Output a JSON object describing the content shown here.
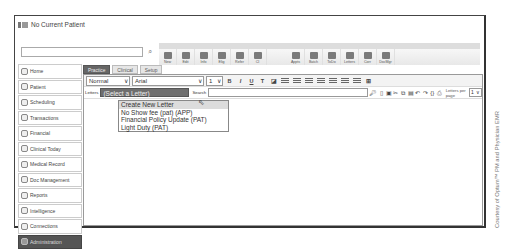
{
  "window": {
    "title": "No Current Patient"
  },
  "patient_search": {
    "value": "",
    "placeholder": ""
  },
  "toolbar": {
    "buttons": [
      {
        "label": "New",
        "icon": "new-icon"
      },
      {
        "label": "Edit",
        "icon": "edit-icon"
      },
      {
        "label": "Info",
        "icon": "info-icon"
      },
      {
        "label": "Elig",
        "icon": "eligibility-icon"
      },
      {
        "label": "Refer",
        "icon": "refer-icon"
      },
      {
        "label": "CI",
        "icon": "ci-icon"
      },
      {
        "label": "Appts",
        "icon": "appointments-icon"
      },
      {
        "label": "Batch",
        "icon": "batch-icon"
      },
      {
        "label": "ToDo",
        "icon": "todo-icon"
      },
      {
        "label": "Letters",
        "icon": "letters-icon"
      },
      {
        "label": "Corr",
        "icon": "correspondence-icon"
      },
      {
        "label": "DocMgr",
        "icon": "document-manager-icon"
      }
    ]
  },
  "sidebar": {
    "items": [
      {
        "label": "Home",
        "icon": "home-arrow-icon"
      },
      {
        "label": "Patient",
        "icon": "patient-icon"
      },
      {
        "label": "Scheduling",
        "icon": "clock-icon"
      },
      {
        "label": "Transactions",
        "icon": "transactions-icon"
      },
      {
        "label": "Financial",
        "icon": "financial-icon"
      },
      {
        "label": "Clinical Today",
        "icon": "stethoscope-icon"
      },
      {
        "label": "Medical Record",
        "icon": "medical-record-icon"
      },
      {
        "label": "Doc Management",
        "icon": "document-icon"
      },
      {
        "label": "Reports",
        "icon": "reports-icon"
      },
      {
        "label": "Intelligence",
        "icon": "intelligence-icon"
      },
      {
        "label": "Connections",
        "icon": "connections-icon"
      },
      {
        "label": "Administration",
        "icon": "gears-icon",
        "active": true
      }
    ]
  },
  "tabs": [
    {
      "label": "Practice",
      "active": true
    },
    {
      "label": "Clinical"
    },
    {
      "label": "Setup"
    }
  ],
  "format_bar": {
    "style": "Normal",
    "font": "Arial",
    "size": "1",
    "buttons": [
      "B",
      "I",
      "U"
    ]
  },
  "letter_bar": {
    "letters_label": "Letters",
    "letter_selected": "(Select a Letter)",
    "search_label": "Search",
    "search_value": "",
    "letters_per_page_label": "Letters per page",
    "letters_per_page_value": "1"
  },
  "letter_dropdown": {
    "options": [
      "Create New Letter",
      "No Show fee (pat) (APP)",
      "Financial Policy Update (PAT)",
      "Light Duty (PAT)"
    ],
    "highlighted_index": 0
  },
  "credit": "Courtesy of Optum™ PM and Physician EMR"
}
